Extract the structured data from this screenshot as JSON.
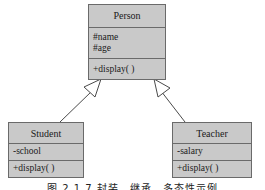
{
  "diagram": {
    "type": "uml-class-inheritance",
    "classes": [
      {
        "name": "Person",
        "attributes": [
          "#name",
          "#age"
        ],
        "methods": [
          "+display( )"
        ]
      },
      {
        "name": "Student",
        "attributes": [
          "-school"
        ],
        "methods": [
          "+display( )"
        ]
      },
      {
        "name": "Teacher",
        "attributes": [
          "-salary"
        ],
        "methods": [
          "+display( )"
        ]
      }
    ],
    "relations": [
      {
        "from": "Student",
        "to": "Person",
        "kind": "generalization"
      },
      {
        "from": "Teacher",
        "to": "Person",
        "kind": "generalization"
      }
    ],
    "caption": "图 2.1.7   封装、继承、多态性示例"
  },
  "colors": {
    "box_fill": "#c9c9c9",
    "box_border": "#6a6a6a",
    "line": "#4a4a4a"
  }
}
